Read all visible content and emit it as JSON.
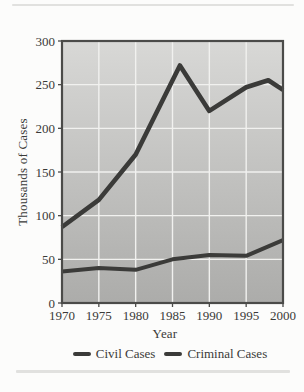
{
  "chart_data": {
    "type": "line",
    "title": "",
    "xlabel": "Year",
    "ylabel": "Thousands of Cases",
    "xlim": [
      1970,
      2000
    ],
    "ylim": [
      0,
      300
    ],
    "xticks": [
      1970,
      1975,
      1980,
      1985,
      1990,
      1995,
      2000
    ],
    "yticks": [
      0,
      50,
      100,
      150,
      200,
      250,
      300
    ],
    "grid": true,
    "legend_position": "bottom-center",
    "plot_colors": {
      "area_gradient_top": "#d8d8d6",
      "area_gradient_bottom": "#acacaa",
      "gridline": "#f1f1ef",
      "border": "#4b4b49",
      "line": "#3b3b39",
      "text": "#3a3a38",
      "page_background": "#fcfcfb"
    },
    "series": [
      {
        "name": "Civil Cases",
        "points": [
          [
            1970,
            87
          ],
          [
            1975,
            118
          ],
          [
            1980,
            170
          ],
          [
            1986,
            272
          ],
          [
            1990,
            220
          ],
          [
            1995,
            247
          ],
          [
            1998,
            255
          ],
          [
            2000,
            244
          ]
        ]
      },
      {
        "name": "Criminal Cases",
        "points": [
          [
            1970,
            36
          ],
          [
            1975,
            40
          ],
          [
            1980,
            38
          ],
          [
            1985,
            50
          ],
          [
            1990,
            55
          ],
          [
            1995,
            54
          ],
          [
            2000,
            72
          ]
        ]
      }
    ]
  }
}
